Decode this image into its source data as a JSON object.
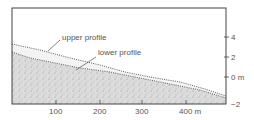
{
  "diagram": {
    "labels": {
      "upper": "upper profile",
      "lower": "lower profile"
    },
    "x_axis": {
      "ticks": [
        {
          "value": 100,
          "label": "100"
        },
        {
          "value": 200,
          "label": "200"
        },
        {
          "value": 300,
          "label": "300"
        },
        {
          "value": 400,
          "label": "400 m"
        }
      ]
    },
    "y_axis": {
      "side": "right",
      "ticks": [
        {
          "value": 4,
          "label": "4"
        },
        {
          "value": 2,
          "label": "2"
        },
        {
          "value": 0,
          "label": "0 m"
        },
        {
          "value": -2,
          "label": "−2"
        }
      ]
    },
    "colors": {
      "frame": "#444444",
      "fill": "#d8d8d8",
      "text": "#555555"
    }
  }
}
